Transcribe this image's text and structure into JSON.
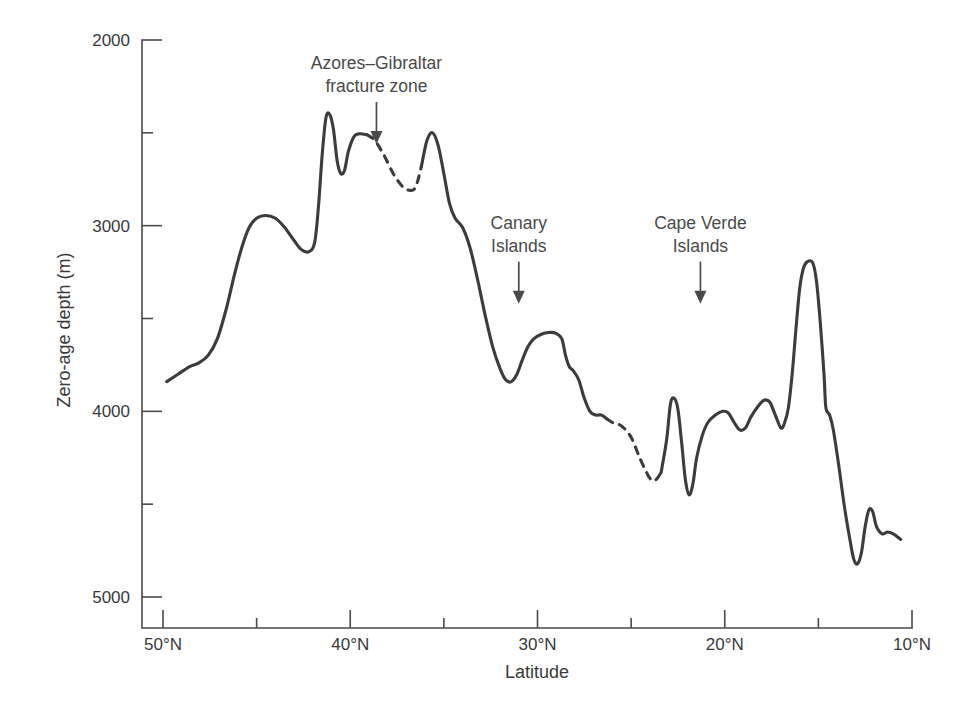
{
  "chart_data": {
    "type": "line",
    "title": "",
    "xlabel": "Latitude",
    "ylabel": "Zero-age depth (m)",
    "xlim": [
      50,
      10
    ],
    "ylim": [
      5000,
      2000
    ],
    "y_axis_inverted": true,
    "x_axis_inverted": true,
    "grid": false,
    "legend": "none",
    "x_major_ticks": [
      50,
      40,
      30,
      20,
      10
    ],
    "x_major_tick_labels": [
      "50°N",
      "40°N",
      "30°N",
      "20°N",
      "10°N"
    ],
    "x_minor_ticks": [
      45,
      35,
      25,
      15
    ],
    "y_major_ticks": [
      2000,
      3000,
      4000,
      5000
    ],
    "y_major_tick_labels": [
      "2000",
      "3000",
      "4000",
      "5000"
    ],
    "y_minor_ticks": [
      2500,
      3500,
      4500
    ],
    "series": [
      {
        "name": "Zero-age depth along the Mid-Atlantic Ridge",
        "style": "solid-with-dashed-gaps",
        "points": [
          [
            49.8,
            3840
          ],
          [
            49.2,
            3800
          ],
          [
            48.6,
            3760
          ],
          [
            48.1,
            3740
          ],
          [
            47.6,
            3700
          ],
          [
            47.1,
            3610
          ],
          [
            46.6,
            3440
          ],
          [
            46.2,
            3270
          ],
          [
            45.8,
            3120
          ],
          [
            45.4,
            3010
          ],
          [
            45.0,
            2960
          ],
          [
            44.5,
            2945
          ],
          [
            44.0,
            2960
          ],
          [
            43.5,
            3010
          ],
          [
            43.0,
            3080
          ],
          [
            42.6,
            3130
          ],
          [
            42.2,
            3140
          ],
          [
            41.9,
            3090
          ],
          [
            41.7,
            2900
          ],
          [
            41.5,
            2620
          ],
          [
            41.3,
            2420
          ],
          [
            41.1,
            2400
          ],
          [
            40.9,
            2480
          ],
          [
            40.7,
            2650
          ],
          [
            40.5,
            2720
          ],
          [
            40.3,
            2700
          ],
          [
            40.1,
            2600
          ],
          [
            39.8,
            2520
          ],
          [
            39.5,
            2505
          ],
          [
            39.1,
            2510
          ],
          [
            38.7,
            2540
          ],
          [
            38.2,
            2620
          ],
          [
            37.7,
            2720
          ],
          [
            37.2,
            2790
          ],
          [
            36.8,
            2810
          ],
          [
            36.5,
            2790
          ],
          [
            36.2,
            2680
          ],
          [
            35.9,
            2540
          ],
          [
            35.6,
            2500
          ],
          [
            35.3,
            2570
          ],
          [
            35.0,
            2720
          ],
          [
            34.7,
            2880
          ],
          [
            34.4,
            2960
          ],
          [
            34.0,
            3010
          ],
          [
            33.6,
            3120
          ],
          [
            33.2,
            3290
          ],
          [
            32.8,
            3480
          ],
          [
            32.4,
            3650
          ],
          [
            32.0,
            3770
          ],
          [
            31.7,
            3830
          ],
          [
            31.4,
            3840
          ],
          [
            31.1,
            3800
          ],
          [
            30.8,
            3720
          ],
          [
            30.5,
            3650
          ],
          [
            30.2,
            3610
          ],
          [
            29.8,
            3585
          ],
          [
            29.4,
            3575
          ],
          [
            29.0,
            3580
          ],
          [
            28.7,
            3610
          ],
          [
            28.5,
            3700
          ],
          [
            28.3,
            3760
          ],
          [
            28.1,
            3780
          ],
          [
            27.8,
            3830
          ],
          [
            27.5,
            3930
          ],
          [
            27.2,
            4000
          ],
          [
            26.9,
            4020
          ],
          [
            26.6,
            4020
          ],
          [
            26.3,
            4040
          ],
          [
            26.0,
            4060
          ],
          [
            25.5,
            4080
          ],
          [
            25.0,
            4140
          ],
          [
            24.5,
            4260
          ],
          [
            24.0,
            4360
          ],
          [
            23.7,
            4370
          ],
          [
            23.4,
            4330
          ],
          [
            23.1,
            4150
          ],
          [
            22.9,
            3960
          ],
          [
            22.7,
            3930
          ],
          [
            22.5,
            3990
          ],
          [
            22.3,
            4170
          ],
          [
            22.1,
            4370
          ],
          [
            21.9,
            4450
          ],
          [
            21.7,
            4390
          ],
          [
            21.5,
            4250
          ],
          [
            21.2,
            4130
          ],
          [
            20.9,
            4060
          ],
          [
            20.5,
            4020
          ],
          [
            20.1,
            4000
          ],
          [
            19.8,
            4010
          ],
          [
            19.5,
            4060
          ],
          [
            19.2,
            4100
          ],
          [
            18.9,
            4090
          ],
          [
            18.6,
            4030
          ],
          [
            18.2,
            3970
          ],
          [
            17.9,
            3940
          ],
          [
            17.6,
            3950
          ],
          [
            17.3,
            4020
          ],
          [
            17.0,
            4090
          ],
          [
            16.8,
            4060
          ],
          [
            16.6,
            3980
          ],
          [
            16.4,
            3800
          ],
          [
            16.2,
            3560
          ],
          [
            16.0,
            3340
          ],
          [
            15.8,
            3230
          ],
          [
            15.6,
            3195
          ],
          [
            15.3,
            3200
          ],
          [
            15.1,
            3300
          ],
          [
            14.9,
            3520
          ],
          [
            14.7,
            3800
          ],
          [
            14.6,
            3980
          ],
          [
            14.4,
            4020
          ],
          [
            14.2,
            4100
          ],
          [
            13.9,
            4300
          ],
          [
            13.6,
            4520
          ],
          [
            13.3,
            4700
          ],
          [
            13.1,
            4800
          ],
          [
            12.9,
            4820
          ],
          [
            12.7,
            4760
          ],
          [
            12.5,
            4620
          ],
          [
            12.3,
            4530
          ],
          [
            12.1,
            4540
          ],
          [
            11.9,
            4620
          ],
          [
            11.6,
            4660
          ],
          [
            11.3,
            4650
          ],
          [
            11.0,
            4660
          ],
          [
            10.6,
            4690
          ]
        ],
        "dashed_segments": [
          {
            "from_lat": 39.1,
            "to_lat": 36.5,
            "label": "inferred across Azores–Gibraltar fracture zone"
          },
          {
            "from_lat": 26.3,
            "to_lat": 23.7,
            "label": "inferred"
          }
        ]
      }
    ],
    "annotations": [
      {
        "id": "azores-gibraltar",
        "lines": [
          "Azores–Gibraltar",
          "fracture zone"
        ],
        "target_lat": 38.6,
        "target_depth": 2560,
        "arrow": "down"
      },
      {
        "id": "canary-islands",
        "lines": [
          "Canary",
          "Islands"
        ],
        "target_lat": 31.0,
        "target_depth": 3420,
        "arrow": "down"
      },
      {
        "id": "cape-verde-islands",
        "lines": [
          "Cape Verde",
          "Islands"
        ],
        "target_lat": 21.3,
        "target_depth": 3420,
        "arrow": "down"
      }
    ],
    "colors": {
      "curve": "#3c3c3c",
      "axis": "#4a4a4a",
      "text": "#3a3a3a",
      "background": "#ffffff"
    }
  }
}
